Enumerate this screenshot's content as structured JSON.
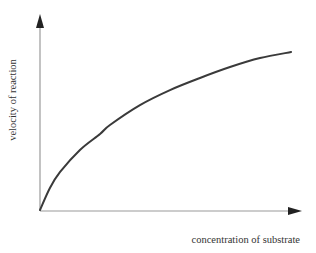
{
  "chart_data": {
    "type": "line",
    "title": "",
    "xlabel": "concentration of substrate",
    "ylabel": "velocity of reaction",
    "xlim": [
      0,
      1
    ],
    "ylim": [
      0,
      1
    ],
    "grid": false,
    "ticks": false,
    "legend": "none",
    "series": [
      {
        "name": "reaction velocity",
        "x": [
          0,
          0.038,
          0.077,
          0.153,
          0.23,
          0.268,
          0.383,
          0.498,
          0.613,
          0.728,
          0.843,
          0.962
        ],
        "y": [
          0,
          0.113,
          0.195,
          0.308,
          0.39,
          0.436,
          0.538,
          0.615,
          0.677,
          0.733,
          0.779,
          0.81
        ]
      }
    ],
    "colors": {
      "curve": "#3a3a3a",
      "axis": "#9a9a9a",
      "arrow": "#222222",
      "text": "#333333"
    }
  }
}
